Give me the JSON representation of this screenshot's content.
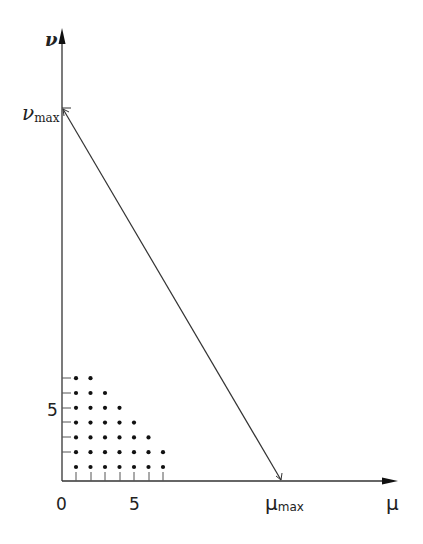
{
  "diagram": {
    "type": "lattice-triangle",
    "axes": {
      "x": {
        "label": "μ",
        "tick_labels": [
          "0",
          "5"
        ],
        "max_label_main": "μ",
        "max_label_sub": "max"
      },
      "y": {
        "label": "ν",
        "tick_labels": [
          "5"
        ],
        "max_label_main": "ν",
        "max_label_sub": "max"
      }
    },
    "lattice_points_per_row": [
      7,
      7,
      6,
      5,
      4,
      3,
      2
    ],
    "line": {
      "from": "ν_max on ν-axis",
      "to": "μ_max on μ-axis"
    },
    "colors": {
      "ink": "#222222",
      "background": "#ffffff"
    }
  },
  "labels": {
    "origin": "0",
    "x_five": "5",
    "y_five": "5",
    "mu": "μ",
    "nu": "ν",
    "mu_max_main": "μ",
    "mu_max_sub": "max",
    "nu_max_main": "ν",
    "nu_max_sub": "max"
  }
}
